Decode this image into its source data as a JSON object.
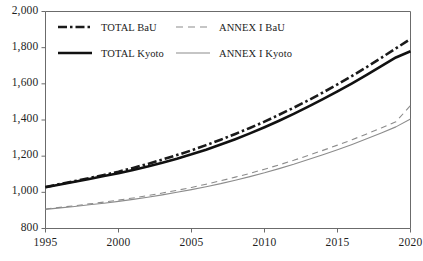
{
  "chart_data": {
    "type": "line",
    "title": "",
    "subtitle": "",
    "xlabel": "",
    "ylabel": "",
    "xlim": [
      1995,
      2020
    ],
    "ylim": [
      800,
      2000
    ],
    "grid": false,
    "legend_position": "top-left-inside",
    "x_tick_labels": [
      "1995",
      "2000",
      "2005",
      "2010",
      "2015",
      "2020"
    ],
    "x_ticks": [
      1995,
      2000,
      2005,
      2010,
      2015,
      2020
    ],
    "y_tick_labels": [
      "800",
      "1,000",
      "1,200",
      "1,400",
      "1,600",
      "1,800",
      "2,000"
    ],
    "y_ticks": [
      800,
      1000,
      1200,
      1400,
      1600,
      1800,
      2000
    ],
    "x": [
      1995,
      1996,
      1997,
      1998,
      1999,
      2000,
      2001,
      2002,
      2003,
      2004,
      2005,
      2006,
      2007,
      2008,
      2009,
      2010,
      2011,
      2012,
      2013,
      2014,
      2015,
      2016,
      2017,
      2018,
      2019,
      2020
    ],
    "series": [
      {
        "name": "TOTAL BaU",
        "color": "#1a1a1a",
        "style": "dash-dot",
        "width": 2.6,
        "values": [
          1030,
          1046,
          1062,
          1079,
          1096,
          1114,
          1135,
          1157,
          1181,
          1206,
          1232,
          1261,
          1291,
          1323,
          1356,
          1391,
          1429,
          1468,
          1509,
          1552,
          1597,
          1644,
          1693,
          1744,
          1796,
          1848
        ]
      },
      {
        "name": "TOTAL Kyoto",
        "color": "#111111",
        "style": "solid",
        "width": 2.6,
        "values": [
          1028,
          1043,
          1058,
          1074,
          1090,
          1106,
          1124,
          1143,
          1164,
          1186,
          1210,
          1236,
          1264,
          1294,
          1326,
          1360,
          1396,
          1434,
          1474,
          1515,
          1558,
          1603,
          1650,
          1698,
          1746,
          1780
        ]
      },
      {
        "name": "ANNEX I BaU",
        "color": "#8c8c8c",
        "style": "dashed",
        "width": 1.1,
        "values": [
          908,
          917,
          926,
          936,
          946,
          957,
          969,
          982,
          996,
          1011,
          1027,
          1045,
          1064,
          1084,
          1105,
          1128,
          1152,
          1177,
          1204,
          1232,
          1261,
          1291,
          1323,
          1356,
          1390,
          1480
        ]
      },
      {
        "name": "ANNEX I Kyoto",
        "color": "#8c8c8c",
        "style": "solid",
        "width": 1.1,
        "values": [
          906,
          914,
          922,
          931,
          940,
          950,
          961,
          973,
          986,
          1000,
          1015,
          1031,
          1048,
          1067,
          1087,
          1108,
          1131,
          1155,
          1181,
          1208,
          1236,
          1265,
          1296,
          1328,
          1362,
          1405
        ]
      }
    ]
  },
  "legend": {
    "rows": [
      {
        "items": [
          {
            "label": "TOTAL BaU",
            "swatch": "dash-dot-thick-black"
          },
          {
            "label": "ANNEX I BaU",
            "swatch": "dashed-thin-gray"
          }
        ]
      },
      {
        "items": [
          {
            "label": "TOTAL Kyoto",
            "swatch": "solid-thick-black"
          },
          {
            "label": "ANNEX I Kyoto",
            "swatch": "solid-thin-gray"
          }
        ]
      }
    ]
  },
  "axes": {
    "axis_color": "#6b6b6b",
    "tick_color": "#6b6b6b"
  }
}
